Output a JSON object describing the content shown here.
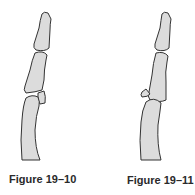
{
  "figures": [
    {
      "caption": "Figure 19–10",
      "description": "Finger phalanges with avulsion fracture fragment at the joint, fragment still near the joint (minimally displaced)"
    },
    {
      "caption": "Figure 19–11",
      "description": "Finger phalanges with avulsion fracture fragment displaced away from the joint"
    }
  ],
  "colors": {
    "bone_fill": "#dcdcdc",
    "bone_stroke": "#333333",
    "caption_text": "#2a2a2a",
    "background": "#ffffff"
  }
}
